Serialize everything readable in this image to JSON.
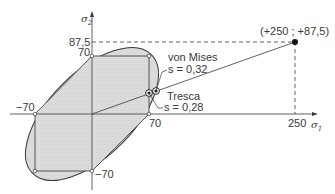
{
  "diagram": {
    "axes": {
      "x_label": "σ",
      "x_sub": "1",
      "y_label": "σ",
      "y_sub": "2"
    },
    "ticks": {
      "y_87_5": "87,5",
      "y_70": "70",
      "x_neg70": "−70",
      "x_70": "70",
      "y_neg70": "−70",
      "x_250": "250"
    },
    "load_point": {
      "label": "(+250 ; +87,5)",
      "sigma1": 250,
      "sigma2": 87.5
    },
    "criteria": [
      {
        "name": "von Mises",
        "s_label": "s = 0,32",
        "s": 0.32
      },
      {
        "name": "Tresca",
        "s_label": "s = 0,28",
        "s": 0.28
      }
    ],
    "yield_stress": 70,
    "colors": {
      "fill": "#dcdcdc",
      "line": "#3a3a3a",
      "background": "#ffffff"
    }
  }
}
